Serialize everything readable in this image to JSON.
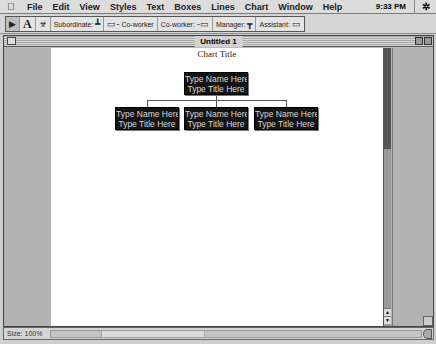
{
  "menubar": {
    "apple_icon": "",
    "items": [
      "File",
      "Edit",
      "View",
      "Styles",
      "Text",
      "Boxes",
      "Lines",
      "Chart",
      "Window",
      "Help"
    ],
    "clock": "9:33 PM",
    "app_icon": "org-chart-app-icon"
  },
  "toolbar": {
    "tools": [
      {
        "name": "arrow-tool",
        "glyph": "➤"
      },
      {
        "name": "text-tool",
        "glyph": "A"
      },
      {
        "name": "org-chart-tool",
        "glyph": "♣"
      }
    ],
    "buttons": [
      {
        "label": "Subordinate:",
        "glyph": "⊥"
      },
      {
        "label": "Co-worker",
        "glyph": "▭-"
      },
      {
        "label": "Co-worker:",
        "glyph": "-▭"
      },
      {
        "label": "Manager:",
        "glyph": "⊤"
      },
      {
        "label": "Assistant:",
        "glyph": "▭"
      }
    ]
  },
  "window": {
    "title": "Untitled 1",
    "chart_title": "Chart Title",
    "nodes": [
      {
        "role": "manager",
        "name": "Type Name Here",
        "title": "Type Title Here"
      },
      {
        "role": "subordinate",
        "name": "Type Name Here",
        "title": "Type Title Here"
      },
      {
        "role": "subordinate",
        "name": "Type Name Here",
        "title": "Type Title Here"
      },
      {
        "role": "subordinate",
        "name": "Type Name Here",
        "title": "Type Title Here"
      }
    ]
  },
  "statusbar": {
    "size_label": "Size: 100%"
  },
  "colors": {
    "node_bg": "#141414",
    "node_text": "#d8d8d8",
    "page_bg": "#ffffff",
    "chrome": "#d4d4d4"
  }
}
